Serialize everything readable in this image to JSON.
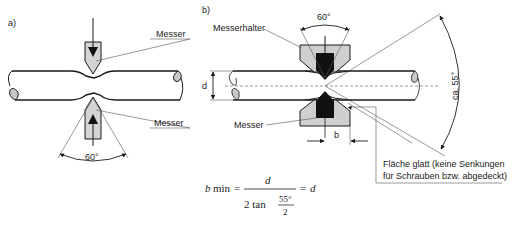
{
  "diagram": {
    "panel_a": {
      "label": "a)",
      "knife_top_label": "Messer",
      "knife_bottom_label": "Messer",
      "angle_label": "60°"
    },
    "panel_b": {
      "label": "b)",
      "holder_label": "Messerhalter",
      "knife_label": "Messer",
      "angle_top_label": "60°",
      "angle_side_label": "ca. 55°",
      "diameter_label": "d",
      "width_label": "b",
      "note_line1": "Fläche glatt (keine Senkungen",
      "note_line2": "für Schrauben bzw. abgedeckt)"
    },
    "formula": {
      "lhs_var": "b",
      "lhs_sub": "min",
      "eq1": "=",
      "numerator": "d",
      "denominator_prefix": "2 tan",
      "frac_num": "55°",
      "frac_den": "2",
      "eq2": "=",
      "rhs": "d"
    },
    "colors": {
      "line": "#1a1a1a",
      "knife_fill": "#d4d4d4",
      "blade_dark": "#111111",
      "holder_fill": "#cfcfcf"
    }
  }
}
